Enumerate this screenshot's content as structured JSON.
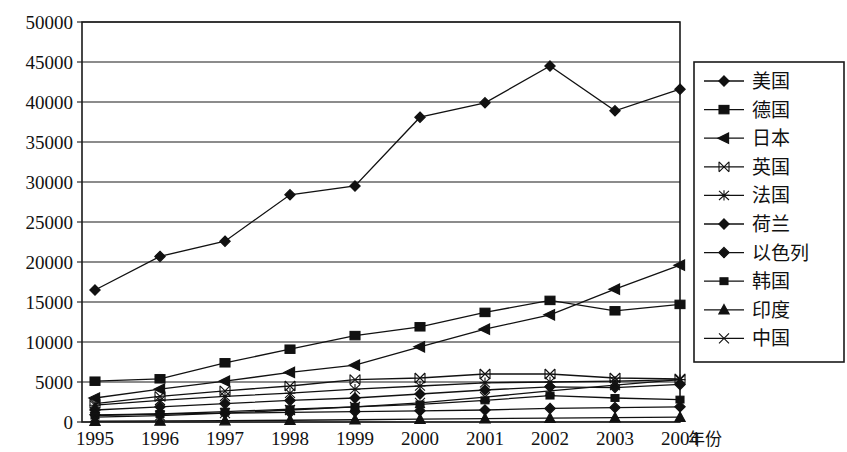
{
  "chart_data": {
    "type": "line",
    "title": "",
    "xlabel": "年份",
    "ylabel": "",
    "categories": [
      "1995",
      "1996",
      "1997",
      "1998",
      "1999",
      "2000",
      "2001",
      "2002",
      "2003",
      "2004"
    ],
    "x": [
      1995,
      1996,
      1997,
      1998,
      1999,
      2000,
      2001,
      2002,
      2003,
      2004
    ],
    "ylim": [
      0,
      50000
    ],
    "ytick_step": 5000,
    "yticks": [
      "0",
      "5000",
      "10000",
      "15000",
      "20000",
      "25000",
      "30000",
      "35000",
      "40000",
      "45000",
      "50000"
    ],
    "grid": "horizontal",
    "legend_position": "right",
    "series": [
      {
        "name": "美国",
        "marker": "diamond",
        "values": [
          16500,
          20700,
          22600,
          28400,
          29500,
          38100,
          39900,
          44500,
          38900,
          41600
        ]
      },
      {
        "name": "德国",
        "marker": "square",
        "values": [
          5100,
          5400,
          7400,
          9100,
          10800,
          11900,
          13700,
          15200,
          13900,
          14700
        ]
      },
      {
        "name": "日本",
        "marker": "triangle-left",
        "values": [
          3000,
          4100,
          5100,
          6200,
          7100,
          9400,
          11600,
          13400,
          16600,
          19600
        ]
      },
      {
        "name": "英国",
        "marker": "bowtie",
        "values": [
          2300,
          3200,
          3900,
          4500,
          5300,
          5500,
          6000,
          6000,
          5500,
          5400
        ]
      },
      {
        "name": "法国",
        "marker": "star",
        "values": [
          2100,
          2700,
          3200,
          3600,
          4100,
          4500,
          4900,
          5000,
          5100,
          5300
        ]
      },
      {
        "name": "荷兰",
        "marker": "diamond",
        "values": [
          1500,
          1900,
          2300,
          2700,
          3000,
          3500,
          4000,
          4400,
          4300,
          4700
        ]
      },
      {
        "name": "以色列",
        "marker": "diamond",
        "values": [
          900,
          1000,
          1100,
          1200,
          1300,
          1400,
          1500,
          1700,
          1800,
          1900
        ]
      },
      {
        "name": "韩国",
        "marker": "square-small",
        "values": [
          800,
          1000,
          1300,
          1600,
          1900,
          2200,
          2700,
          3300,
          3000,
          2800
        ]
      },
      {
        "name": "印度",
        "marker": "triangle-up",
        "values": [
          100,
          130,
          170,
          220,
          280,
          350,
          420,
          480,
          540,
          600
        ]
      },
      {
        "name": "中国",
        "marker": "cross",
        "values": [
          600,
          800,
          1100,
          1500,
          1900,
          2400,
          3100,
          3900,
          4600,
          5300
        ]
      }
    ]
  },
  "axis": {
    "x_axis_title": "年份"
  },
  "legend": {
    "entries": [
      {
        "label": "美国",
        "marker": "diamond"
      },
      {
        "label": "德国",
        "marker": "square"
      },
      {
        "label": "日本",
        "marker": "triangle-left"
      },
      {
        "label": "英国",
        "marker": "bowtie"
      },
      {
        "label": "法国",
        "marker": "star"
      },
      {
        "label": "荷兰",
        "marker": "diamond"
      },
      {
        "label": "以色列",
        "marker": "diamond"
      },
      {
        "label": "韩国",
        "marker": "square-small"
      },
      {
        "label": "印度",
        "marker": "triangle-up"
      },
      {
        "label": "中国",
        "marker": "cross"
      }
    ]
  },
  "colors": {
    "ink": "#111111",
    "grid": "#1a1a1a",
    "background": "#ffffff"
  }
}
